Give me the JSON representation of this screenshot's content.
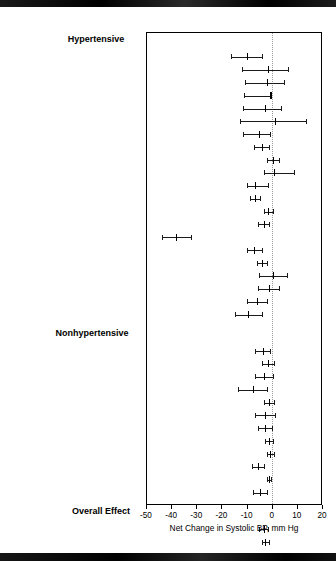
{
  "figure": {
    "axis_title": "Net Change in Systolic BP, mm Hg",
    "tick_labels": [
      "-50",
      "-40",
      "-30",
      "-20",
      "-10",
      "0",
      "10",
      "20"
    ],
    "sections": [
      {
        "id": "hypertensive",
        "label": "Hypertensive"
      },
      {
        "id": "nonhypertensive",
        "label": "Nonhypertensive"
      },
      {
        "id": "overall",
        "label": "Overall Effect"
      }
    ]
  },
  "chart_data": {
    "type": "scatter",
    "title": "",
    "xlabel": "Net Change in Systolic BP, mm Hg",
    "ylabel": "",
    "xlim": [
      -50,
      20
    ],
    "xticks": [
      -50,
      -40,
      -30,
      -20,
      -10,
      0,
      10,
      20
    ],
    "grid": false,
    "reference_line": 0,
    "legend": "none",
    "groups": [
      {
        "name": "Hypertensive",
        "rows": [
          {
            "label": "MacGregor et al,",
            "ref": "51",
            "year": "1982",
            "suffix": "",
            "est": -10.0,
            "lo": -16.3,
            "hi": -3.7
          },
          {
            "label": "Richards et al,",
            "ref": "53",
            "year": "1984",
            "suffix": "",
            "est": -1.5,
            "lo": -12.0,
            "hi": 6.5
          },
          {
            "label": "Smith et al,",
            "ref": "54",
            "year": "1985",
            "suffix": "",
            "est": -2.0,
            "lo": -10.5,
            "hi": 5.0
          },
          {
            "label": "Kaplan et al,",
            "ref": "55",
            "year": "1985",
            "suffix": "",
            "est": -0.5,
            "lo": -11.0,
            "hi": -0.5,
            "bold": true
          },
          {
            "label": "Zoccali et al,",
            "ref": "56",
            "year": "1985",
            "suffix": "",
            "est": -2.5,
            "lo": -11.5,
            "hi": 3.5
          },
          {
            "label": "Bulpitt et al,",
            "ref": "57",
            "year": "1985",
            "suffix": "",
            "est": 1.5,
            "lo": -12.5,
            "hi": 13.5
          },
          {
            "label": "Matlou et al,",
            "ref": "58",
            "year": "1986",
            "suffix": "",
            "est": -5.0,
            "lo": -11.5,
            "hi": -0.5
          },
          {
            "label": "Chalmers et al,",
            "ref": "61",
            "year": "1986",
            "suffix": "(a)",
            "est": -4.0,
            "lo": -7.0,
            "hi": -1.0
          },
          {
            "label": "",
            "ref": "",
            "year": "",
            "suffix": "(b)",
            "est": 0.5,
            "lo": -2.0,
            "hi": 3.0
          },
          {
            "label": "Grobbee et al,",
            "ref": "62",
            "year": "1987",
            "suffix": "",
            "est": 1.0,
            "lo": -3.0,
            "hi": 9.0
          },
          {
            "label": "Siani et al,",
            "ref": "63",
            "year": "1987",
            "suffix": "",
            "est": -6.5,
            "lo": -10.0,
            "hi": -1.5
          },
          {
            "label": "Svetkey et al,",
            "ref": "64",
            "year": "1987",
            "suffix": "",
            "est": -6.5,
            "lo": -8.5,
            "hi": -4.5
          },
          {
            "label": "MRC,",
            "ref": "65",
            "year": "1987",
            "suffix": "",
            "est": -1.5,
            "lo": -3.0,
            "hi": 0.5
          },
          {
            "label": "Grimm et al,",
            "ref": "66",
            "year": "1988",
            "suffix": "",
            "est": -3.0,
            "lo": -5.5,
            "hi": -1.0
          },
          {
            "label": "Obel,",
            "ref": "68",
            "year": "1989",
            "suffix": "",
            "est": -38.0,
            "lo": -43.5,
            "hi": -32.0
          },
          {
            "label": "Patki et al,",
            "ref": "72",
            "year": "1990",
            "suffix": "",
            "est": -7.0,
            "lo": -10.0,
            "hi": -4.0
          },
          {
            "label": "Valdes et al,",
            "ref": "73",
            "year": "1991",
            "suffix": "",
            "est": -4.0,
            "lo": -6.0,
            "hi": -2.0
          },
          {
            "label": "Overlack et al,",
            "ref": "74",
            "year": "1991",
            "suffix": "",
            "est": 0.5,
            "lo": -5.0,
            "hi": 6.0
          },
          {
            "label": "Smith et al,",
            "ref": "76",
            "year": "1992",
            "suffix": "",
            "est": -1.0,
            "lo": -5.5,
            "hi": 3.0
          },
          {
            "label": "Fotherby and Potter,",
            "ref": "77",
            "year": "1992",
            "suffix": "",
            "est": -6.0,
            "lo": -10.0,
            "hi": -2.0
          },
          {
            "label": "",
            "ref": "",
            "year": "",
            "suffix": "",
            "est": -9.5,
            "lo": -14.5,
            "hi": -4.0
          }
        ]
      },
      {
        "name": "Nonhypertensive",
        "rows": [
          {
            "label": "Skrabal et al,",
            "ref": "50",
            "year": "1981",
            "suffix": "(a)",
            "est": -3.5,
            "lo": -6.5,
            "hi": -0.5
          },
          {
            "label": "",
            "ref": "",
            "year": "",
            "suffix": "(b)",
            "est": -1.5,
            "lo": -4.0,
            "hi": 1.0
          },
          {
            "label": "Khaw and Thom,",
            "ref": "52",
            "year": "1982",
            "suffix": "",
            "est": -3.0,
            "lo": -6.5,
            "hi": 0.5
          },
          {
            "label": "Barden et al,",
            "ref": "59",
            "year": "1986",
            "suffix": "",
            "est": -7.5,
            "lo": -13.5,
            "hi": -2.0
          },
          {
            "label": "Poulter and Sever,",
            "ref": "60",
            "year": "1986",
            "suffix": "",
            "est": -1.0,
            "lo": -3.0,
            "hi": 1.0
          },
          {
            "label": "Krishna et al,",
            "ref": "69",
            "year": "1989",
            "suffix": "",
            "est": -2.5,
            "lo": -6.5,
            "hi": 1.5
          },
          {
            "label": "HPT,",
            "ref": "70",
            "year": "1990",
            "suffix": "",
            "est": -2.5,
            "lo": -5.5,
            "hi": 0.0
          },
          {
            "label": "Mullen and O'Connor,",
            "ref": "71",
            "year": "1990",
            "suffix": "(a)",
            "est": -1.0,
            "lo": -2.5,
            "hi": 0.5
          },
          {
            "label": "",
            "ref": "",
            "year": "",
            "suffix": "(b)",
            "est": -0.5,
            "lo": -2.0,
            "hi": 1.0
          },
          {
            "label": "Barden et al,",
            "ref": "74",
            "year": "1991",
            "suffix": "",
            "est": -5.5,
            "lo": -8.0,
            "hi": -3.0
          },
          {
            "label": "Whelton et al,",
            "ref": "78",
            "year": "1995",
            "suffix": "",
            "est": -1.0,
            "lo": -1.8,
            "hi": -0.2
          },
          {
            "label": "Brancati et al,",
            "ref": "79",
            "year": "1996",
            "suffix": "",
            "est": -4.5,
            "lo": -7.5,
            "hi": -2.0
          }
        ]
      },
      {
        "name": "Overall Effect",
        "rows": [
          {
            "label": "All Trials",
            "ref": "",
            "year": "",
            "suffix": "",
            "est": -3.0,
            "lo": -5.0,
            "hi": -1.5
          },
          {
            "label": "Without Outlier",
            "ref": "",
            "year": "",
            "suffix": "",
            "est": -2.5,
            "lo": -4.0,
            "hi": -1.2
          }
        ]
      }
    ]
  }
}
